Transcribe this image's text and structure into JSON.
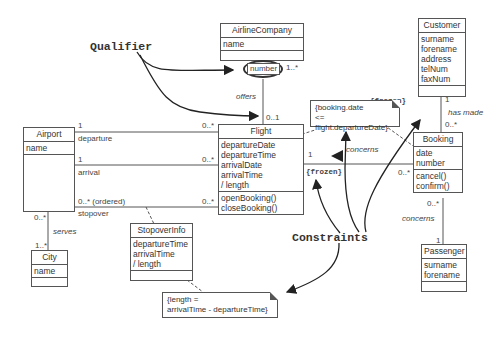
{
  "classes": {
    "airline_company": {
      "name": "AirlineCompany",
      "attributes": [
        "name"
      ],
      "operations": []
    },
    "customer": {
      "name": "Customer",
      "attributes": [
        "surname",
        "forename",
        "address",
        "telNum",
        "faxNum"
      ],
      "operations": []
    },
    "airport": {
      "name": "Airport",
      "attributes": [
        "name"
      ],
      "operations": []
    },
    "flight": {
      "name": "Flight",
      "attributes": [
        "departureDate",
        "departureTime",
        "arrivalDate",
        "arrivalTime",
        "/ length"
      ],
      "operations": [
        "openBooking()",
        "closeBooking()"
      ]
    },
    "booking": {
      "name": "Booking",
      "attributes": [
        "date",
        "number"
      ],
      "operations": [
        "cancel()",
        "confirm()"
      ]
    },
    "stopover_info": {
      "name": "StopoverInfo",
      "attributes": [
        "departureTime",
        "arrivalTime",
        "/ length"
      ],
      "operations": []
    },
    "city": {
      "name": "City",
      "attributes": [
        "name"
      ],
      "operations": []
    },
    "passenger": {
      "name": "Passenger",
      "attributes": [
        "surname",
        "forename"
      ],
      "operations": []
    }
  },
  "qualifier": {
    "label": "number",
    "multiplicity": "1..*"
  },
  "associations": {
    "offers": {
      "name": "offers",
      "mult_flight": "0..1"
    },
    "departure": {
      "role": "departure",
      "mult_airport": "1",
      "mult_flight": "0..*"
    },
    "arrival": {
      "role": "arrival",
      "mult_airport": "1",
      "mult_flight": "0..*"
    },
    "stopover": {
      "role": "stopover",
      "mult_airport": "0..* (ordered)",
      "mult_flight": "0..*"
    },
    "serves": {
      "name": "serves",
      "mult_airport": "0..*",
      "mult_city": "1..*"
    },
    "has_made": {
      "name": "has made",
      "mult_customer": "1",
      "mult_booking": "0..*"
    },
    "concerns_flight": {
      "name": "concerns",
      "mult_flight": "1",
      "mult_booking": "0..*"
    },
    "concerns_passenger": {
      "name": "concerns",
      "mult_booking": "0..*",
      "mult_passenger": "1"
    }
  },
  "constraints": {
    "frozen_1": "{frozen}",
    "frozen_2": "{frozen}",
    "booking_note": [
      "{booking.date",
      "<= flight.departureDate}"
    ],
    "length_note": [
      "{length =",
      "arrivalTime - departureTime}"
    ]
  },
  "annotations": {
    "qualifier_label": "Qualifier",
    "constraints_label": "Constraints"
  }
}
